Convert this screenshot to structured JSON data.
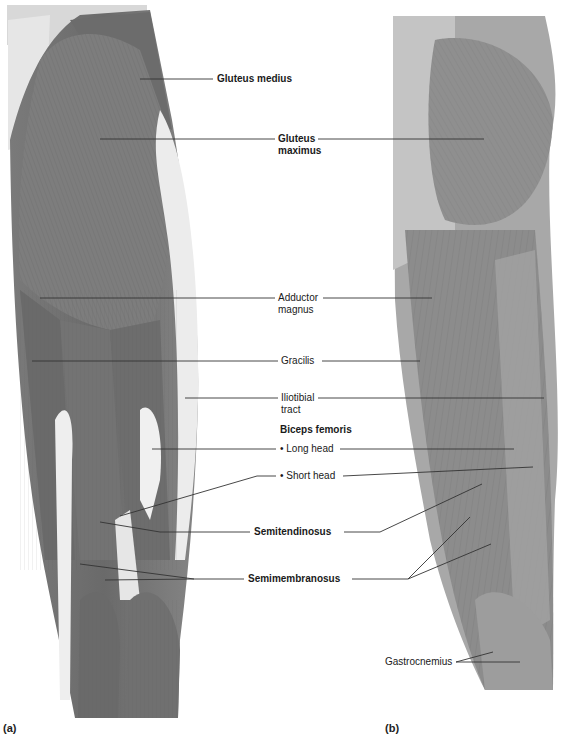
{
  "figure": {
    "panels": [
      {
        "id": "a",
        "tag": "(a)",
        "kind": "illustration"
      },
      {
        "id": "b",
        "tag": "(b)",
        "kind": "cadaver-photo"
      }
    ],
    "labels": {
      "gluteus_medius": "Gluteus medius",
      "gluteus_maximus_1": "Gluteus",
      "gluteus_maximus_2": "maximus",
      "adductor_magnus_1": "Adductor",
      "adductor_magnus_2": "magnus",
      "gracilis": "Gracilis",
      "iliotibial_1": "Iliotibial",
      "iliotibial_2": "tract",
      "biceps_femoris": "Biceps femoris",
      "long_head": "• Long head",
      "short_head": "• Short head",
      "semitendinosus": "Semitendinosus",
      "semimembranosus": "Semimembranosus",
      "gastrocnemius": "Gastrocnemius"
    },
    "colors": {
      "muscle_dark": "#6e6e6e",
      "muscle_mid": "#8a8a8a",
      "tendon_light": "#e8e8e8",
      "photo_bg": "#9a9a9a",
      "leader_line": "#333333"
    }
  }
}
